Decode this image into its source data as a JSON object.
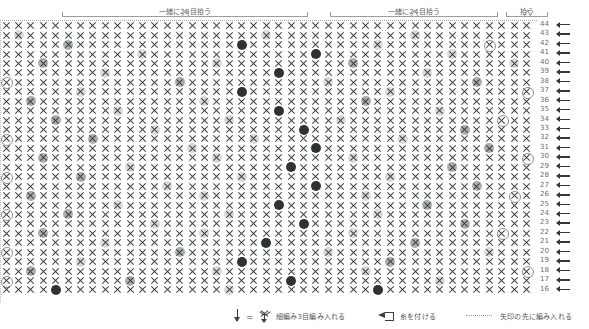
{
  "document": {
    "kind": "japanese-crochet-chart",
    "title": ""
  },
  "top_brackets": [
    {
      "label": "一緒に28目拾う",
      "left": 62,
      "width": 246
    },
    {
      "label": "一緒に24目拾う",
      "left": 330,
      "width": 168
    },
    {
      "label": "拾う",
      "left": 506,
      "width": 42
    }
  ],
  "chart": {
    "type": "stitch-grid",
    "columns": 43,
    "rows": 29,
    "row_number_top": 44,
    "row_number_bottom": 16,
    "base_symbol": "single-crochet-x",
    "row_numbers": [
      44,
      43,
      42,
      41,
      40,
      39,
      38,
      37,
      36,
      35,
      34,
      33,
      32,
      31,
      30,
      29,
      28,
      27,
      26,
      25,
      24,
      23,
      22,
      21,
      20,
      19,
      18,
      17,
      16
    ],
    "row_direction_icon": "left-arrow",
    "markers": {
      "hollow": {
        "name": "increase-ring-hollow",
        "color": "#8e9195"
      },
      "pale": {
        "name": "increase-ring-pale",
        "color": "#d9dcd4"
      },
      "sage": {
        "name": "increase-ring-sage",
        "color": "#aab0a4"
      },
      "dark": {
        "name": "increase-ring-dark",
        "color": "#2f3338"
      }
    },
    "marker_cells": [
      {
        "row": 44,
        "cells": []
      },
      {
        "row": 43,
        "cells": [
          [
            1,
            "pale"
          ],
          [
            21,
            "pale"
          ],
          [
            33,
            "pale"
          ]
        ]
      },
      {
        "row": 42,
        "cells": [
          [
            5,
            "sage"
          ],
          [
            19,
            "dark"
          ],
          [
            30,
            "pale"
          ],
          [
            39,
            "hollow"
          ]
        ]
      },
      {
        "row": 41,
        "cells": [
          [
            11,
            "pale"
          ],
          [
            25,
            "dark"
          ],
          [
            36,
            "pale"
          ]
        ]
      },
      {
        "row": 40,
        "cells": [
          [
            3,
            "sage"
          ],
          [
            17,
            "pale"
          ],
          [
            28,
            "sage"
          ],
          [
            41,
            "pale"
          ]
        ]
      },
      {
        "row": 39,
        "cells": [
          [
            8,
            "pale"
          ],
          [
            22,
            "dark"
          ],
          [
            34,
            "pale"
          ]
        ]
      },
      {
        "row": 38,
        "cells": [
          [
            0,
            "hollow"
          ],
          [
            14,
            "sage"
          ],
          [
            26,
            "pale"
          ],
          [
            38,
            "sage"
          ]
        ]
      },
      {
        "row": 37,
        "cells": [
          [
            6,
            "pale"
          ],
          [
            19,
            "dark"
          ],
          [
            31,
            "pale"
          ],
          [
            42,
            "hollow"
          ]
        ]
      },
      {
        "row": 36,
        "cells": [
          [
            2,
            "sage"
          ],
          [
            16,
            "pale"
          ],
          [
            29,
            "sage"
          ]
        ]
      },
      {
        "row": 35,
        "cells": [
          [
            9,
            "pale"
          ],
          [
            22,
            "dark"
          ],
          [
            35,
            "pale"
          ]
        ]
      },
      {
        "row": 34,
        "cells": [
          [
            4,
            "sage"
          ],
          [
            18,
            "pale"
          ],
          [
            27,
            "pale"
          ],
          [
            40,
            "hollow"
          ]
        ]
      },
      {
        "row": 33,
        "cells": [
          [
            12,
            "pale"
          ],
          [
            24,
            "dark"
          ],
          [
            37,
            "sage"
          ]
        ]
      },
      {
        "row": 32,
        "cells": [
          [
            0,
            "hollow"
          ],
          [
            7,
            "sage"
          ],
          [
            20,
            "pale"
          ],
          [
            32,
            "pale"
          ]
        ]
      },
      {
        "row": 31,
        "cells": [
          [
            15,
            "pale"
          ],
          [
            25,
            "dark"
          ],
          [
            39,
            "sage"
          ]
        ]
      },
      {
        "row": 30,
        "cells": [
          [
            3,
            "sage"
          ],
          [
            17,
            "pale"
          ],
          [
            28,
            "pale"
          ],
          [
            42,
            "hollow"
          ]
        ]
      },
      {
        "row": 29,
        "cells": [
          [
            10,
            "pale"
          ],
          [
            23,
            "dark"
          ],
          [
            36,
            "sage"
          ]
        ]
      },
      {
        "row": 28,
        "cells": [
          [
            0,
            "hollow"
          ],
          [
            6,
            "sage"
          ],
          [
            19,
            "pale"
          ],
          [
            31,
            "pale"
          ]
        ]
      },
      {
        "row": 27,
        "cells": [
          [
            13,
            "pale"
          ],
          [
            25,
            "dark"
          ],
          [
            38,
            "sage"
          ]
        ]
      },
      {
        "row": 26,
        "cells": [
          [
            2,
            "sage"
          ],
          [
            16,
            "pale"
          ],
          [
            29,
            "pale"
          ],
          [
            41,
            "hollow"
          ]
        ]
      },
      {
        "row": 25,
        "cells": [
          [
            9,
            "pale"
          ],
          [
            22,
            "dark"
          ],
          [
            34,
            "sage"
          ]
        ]
      },
      {
        "row": 24,
        "cells": [
          [
            0,
            "hollow"
          ],
          [
            5,
            "sage"
          ],
          [
            18,
            "pale"
          ],
          [
            30,
            "pale"
          ]
        ]
      },
      {
        "row": 23,
        "cells": [
          [
            12,
            "pale"
          ],
          [
            24,
            "dark"
          ],
          [
            37,
            "sage"
          ]
        ]
      },
      {
        "row": 22,
        "cells": [
          [
            3,
            "sage"
          ],
          [
            16,
            "pale"
          ],
          [
            28,
            "pale"
          ],
          [
            40,
            "hollow"
          ]
        ]
      },
      {
        "row": 21,
        "cells": [
          [
            8,
            "pale"
          ],
          [
            21,
            "dark"
          ],
          [
            33,
            "sage"
          ]
        ]
      },
      {
        "row": 20,
        "cells": [
          [
            0,
            "hollow"
          ],
          [
            14,
            "sage"
          ],
          [
            26,
            "pale"
          ],
          [
            39,
            "pale"
          ]
        ]
      },
      {
        "row": 19,
        "cells": [
          [
            6,
            "pale"
          ],
          [
            19,
            "dark"
          ],
          [
            31,
            "sage"
          ]
        ]
      },
      {
        "row": 18,
        "cells": [
          [
            2,
            "sage"
          ],
          [
            17,
            "pale"
          ],
          [
            29,
            "pale"
          ],
          [
            42,
            "hollow"
          ]
        ]
      },
      {
        "row": 17,
        "cells": [
          [
            0,
            "hollow"
          ],
          [
            10,
            "sage"
          ],
          [
            23,
            "dark"
          ],
          [
            35,
            "pale"
          ]
        ]
      },
      {
        "row": 16,
        "cells": [
          [
            4,
            "dark"
          ],
          [
            18,
            "pale"
          ],
          [
            30,
            "dark"
          ]
        ]
      }
    ]
  },
  "legend": {
    "items": [
      {
        "symbol": "arrow-down-equals-3sc",
        "text": "細編み3目編み入れる"
      },
      {
        "symbol": "attach-yarn-triangle",
        "text": "糸を付ける"
      },
      {
        "symbol": "dotted-line",
        "text": "矢印の先に編み入れる"
      }
    ]
  }
}
